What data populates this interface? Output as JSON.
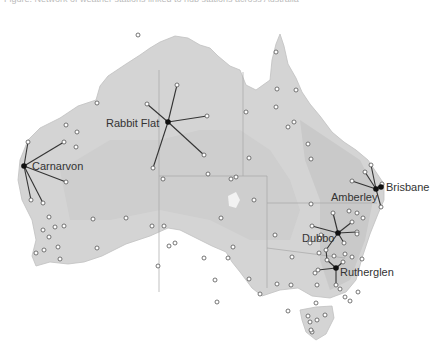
{
  "caption": "Figure: Network of weather stations linked to hub stations across Australia",
  "colors": {
    "land": "#d6d6d6",
    "land_dark": "#c4c4c4",
    "border": "#a8a8a8",
    "link": "#333333",
    "hub": "#111111",
    "station_stroke": "#555555",
    "station_fill": "#ffffff"
  },
  "hubs": [
    {
      "id": "carnarvon",
      "label": "Carnarvon",
      "x": 24,
      "y": 166,
      "lx": 32,
      "ly": 170
    },
    {
      "id": "rabbit-flat",
      "label": "Rabbit Flat",
      "x": 168,
      "y": 122,
      "lx": 106,
      "ly": 127
    },
    {
      "id": "amberley",
      "label": "Amberley",
      "x": 376,
      "y": 189,
      "lx": 331,
      "ly": 201
    },
    {
      "id": "brisbane",
      "label": "Brisbane",
      "x": 381,
      "y": 187,
      "lx": 386,
      "ly": 191
    },
    {
      "id": "dubbo",
      "label": "Dubbo",
      "x": 338,
      "y": 233,
      "lx": 302,
      "ly": 242
    },
    {
      "id": "rutherglen",
      "label": "Rutherglen",
      "x": 336,
      "y": 268,
      "lx": 340,
      "ly": 276
    }
  ],
  "links": [
    [
      24,
      166,
      28,
      142
    ],
    [
      24,
      166,
      64,
      142
    ],
    [
      24,
      166,
      66,
      182
    ],
    [
      24,
      166,
      31,
      200
    ],
    [
      24,
      166,
      43,
      203
    ],
    [
      168,
      122,
      177,
      85
    ],
    [
      168,
      122,
      147,
      104
    ],
    [
      168,
      122,
      207,
      116
    ],
    [
      168,
      122,
      204,
      155
    ],
    [
      168,
      122,
      153,
      168
    ],
    [
      376,
      189,
      352,
      181
    ],
    [
      376,
      189,
      365,
      172
    ],
    [
      376,
      189,
      371,
      165
    ],
    [
      376,
      189,
      382,
      184
    ],
    [
      376,
      189,
      381,
      207
    ],
    [
      338,
      233,
      333,
      213
    ],
    [
      338,
      233,
      312,
      226
    ],
    [
      338,
      233,
      352,
      222
    ],
    [
      338,
      233,
      357,
      232
    ],
    [
      338,
      233,
      344,
      243
    ],
    [
      338,
      233,
      326,
      250
    ],
    [
      326,
      250,
      327,
      260
    ],
    [
      327,
      260,
      336,
      268
    ],
    [
      336,
      268,
      343,
      262
    ],
    [
      336,
      268,
      318,
      270
    ],
    [
      336,
      268,
      336,
      285
    ]
  ],
  "stations": [
    [
      28,
      142
    ],
    [
      64,
      142
    ],
    [
      66,
      182
    ],
    [
      31,
      200
    ],
    [
      43,
      203
    ],
    [
      177,
      85
    ],
    [
      147,
      104
    ],
    [
      207,
      116
    ],
    [
      204,
      155
    ],
    [
      153,
      168
    ],
    [
      352,
      181
    ],
    [
      365,
      172
    ],
    [
      371,
      165
    ],
    [
      382,
      184
    ],
    [
      381,
      207
    ],
    [
      333,
      213
    ],
    [
      312,
      226
    ],
    [
      352,
      222
    ],
    [
      357,
      232
    ],
    [
      344,
      243
    ],
    [
      326,
      250
    ],
    [
      327,
      260
    ],
    [
      343,
      262
    ],
    [
      318,
      270
    ],
    [
      336,
      285
    ],
    [
      138,
      35
    ],
    [
      97,
      103
    ],
    [
      66,
      125
    ],
    [
      77,
      132
    ],
    [
      76,
      147
    ],
    [
      49,
      217
    ],
    [
      55,
      227
    ],
    [
      64,
      226
    ],
    [
      43,
      230
    ],
    [
      49,
      237
    ],
    [
      58,
      247
    ],
    [
      44,
      250
    ],
    [
      36,
      253
    ],
    [
      60,
      259
    ],
    [
      93,
      219
    ],
    [
      97,
      248
    ],
    [
      152,
      226
    ],
    [
      126,
      218
    ],
    [
      158,
      266
    ],
    [
      164,
      226
    ],
    [
      169,
      246
    ],
    [
      175,
      243
    ],
    [
      163,
      179
    ],
    [
      208,
      174
    ],
    [
      236,
      177
    ],
    [
      231,
      179
    ],
    [
      276,
      52
    ],
    [
      277,
      89
    ],
    [
      276,
      107
    ],
    [
      296,
      90
    ],
    [
      294,
      122
    ],
    [
      288,
      127
    ],
    [
      311,
      159
    ],
    [
      308,
      144
    ],
    [
      246,
      112
    ],
    [
      249,
      158
    ],
    [
      254,
      200
    ],
    [
      275,
      235
    ],
    [
      311,
      204
    ],
    [
      321,
      235
    ],
    [
      292,
      257
    ],
    [
      310,
      243
    ],
    [
      315,
      273
    ],
    [
      317,
      285
    ],
    [
      334,
      256
    ],
    [
      345,
      297
    ],
    [
      358,
      292
    ],
    [
      233,
      247
    ],
    [
      221,
      218
    ],
    [
      204,
      258
    ],
    [
      228,
      258
    ],
    [
      215,
      280
    ],
    [
      249,
      279
    ],
    [
      260,
      294
    ],
    [
      277,
      284
    ],
    [
      291,
      285
    ],
    [
      319,
      253
    ],
    [
      320,
      238
    ],
    [
      349,
      211
    ],
    [
      357,
      213
    ],
    [
      363,
      218
    ],
    [
      357,
      234
    ],
    [
      345,
      254
    ],
    [
      352,
      257
    ],
    [
      362,
      259
    ],
    [
      340,
      289
    ],
    [
      350,
      301
    ],
    [
      217,
      302
    ],
    [
      316,
      303
    ],
    [
      288,
      311
    ],
    [
      308,
      316
    ],
    [
      310,
      322
    ],
    [
      312,
      332
    ],
    [
      311,
      330
    ],
    [
      317,
      320
    ],
    [
      325,
      315
    ]
  ],
  "state_borders": [
    "M159 70 L159 292",
    "M243 72 L243 176",
    "M159 176 L267 176",
    "M267 176 L267 288",
    "M267 203 L377 203",
    "M267 248 L345 258"
  ]
}
